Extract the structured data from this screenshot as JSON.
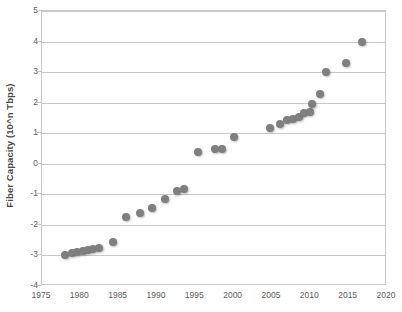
{
  "chart_data": {
    "type": "scatter",
    "title": "",
    "xlabel": "",
    "ylabel": "Fiber Capacity (10^n Tbps)",
    "xlim": [
      1975,
      2020
    ],
    "ylim": [
      -4,
      5
    ],
    "xticks": [
      1975,
      1980,
      1985,
      1990,
      1995,
      2000,
      2005,
      2010,
      2015,
      2020
    ],
    "yticks": [
      -4,
      -3,
      -2,
      -1,
      0,
      1,
      2,
      3,
      4,
      5
    ],
    "grid": "horizontal",
    "legend": "none",
    "marker_color": "#7f7f7f",
    "series": [
      {
        "name": "Fiber Capacity",
        "points": [
          [
            1978.0,
            -3.0
          ],
          [
            1978.9,
            -2.92
          ],
          [
            1979.6,
            -2.9
          ],
          [
            1980.3,
            -2.87
          ],
          [
            1981.0,
            -2.83
          ],
          [
            1981.7,
            -2.78
          ],
          [
            1982.4,
            -2.76
          ],
          [
            1984.2,
            -2.55
          ],
          [
            1986.0,
            -1.75
          ],
          [
            1987.8,
            -1.6
          ],
          [
            1989.4,
            -1.45
          ],
          [
            1991.0,
            -1.15
          ],
          [
            1992.6,
            -0.88
          ],
          [
            1993.5,
            -0.82
          ],
          [
            1995.3,
            0.38
          ],
          [
            1997.6,
            0.5
          ],
          [
            1998.5,
            0.48
          ],
          [
            2000.0,
            0.88
          ],
          [
            2004.8,
            1.18
          ],
          [
            2006.0,
            1.3
          ],
          [
            2006.9,
            1.42
          ],
          [
            2007.7,
            1.45
          ],
          [
            2008.5,
            1.52
          ],
          [
            2009.2,
            1.65
          ],
          [
            2009.9,
            1.7
          ],
          [
            2010.2,
            1.95
          ],
          [
            2011.2,
            2.3
          ],
          [
            2012.1,
            3.0
          ],
          [
            2014.6,
            3.3
          ],
          [
            2016.8,
            4.0
          ]
        ]
      }
    ]
  },
  "axes": {
    "y_title": "Fiber Capacity (10^n Tbps)",
    "y_tick_labels": [
      "5",
      "4",
      "3",
      "2",
      "1",
      "0",
      "-1",
      "-2",
      "-3",
      "-4"
    ],
    "x_tick_labels": [
      "1975",
      "1980",
      "1985",
      "1990",
      "1995",
      "2000",
      "2005",
      "2010",
      "2015",
      "2020"
    ]
  }
}
